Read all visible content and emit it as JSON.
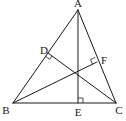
{
  "diagram": {
    "type": "triangle-altitudes",
    "line_color": "#1a1a1a",
    "background": "#ffffff",
    "points": {
      "A": {
        "label": "A",
        "x": 78,
        "y": 10,
        "lx": 78,
        "ly": 7
      },
      "B": {
        "label": "B",
        "x": 13,
        "y": 103,
        "lx": 6,
        "ly": 114
      },
      "C": {
        "label": "C",
        "x": 116,
        "y": 103,
        "lx": 119,
        "ly": 114
      },
      "D": {
        "label": "D",
        "x": 48,
        "y": 53,
        "lx": 44,
        "ly": 54
      },
      "E": {
        "label": "E",
        "x": 78,
        "y": 103,
        "lx": 78,
        "ly": 116
      },
      "F": {
        "label": "F",
        "x": 97,
        "y": 62,
        "lx": 104,
        "ly": 64
      }
    },
    "segments": [
      "AB",
      "BC",
      "CA",
      "AE",
      "BF",
      "CD"
    ],
    "right_angles": [
      "D",
      "E",
      "F"
    ]
  }
}
